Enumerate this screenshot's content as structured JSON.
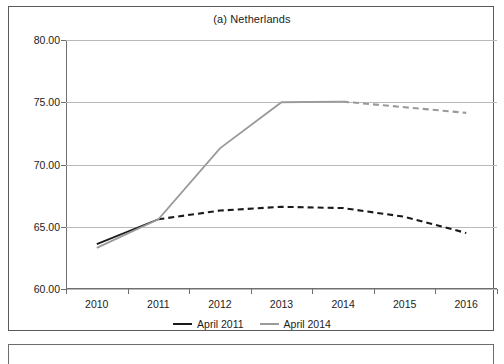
{
  "figure": {
    "title": "(a) Netherlands",
    "frame_color": "#5a5a5a",
    "background": "#ffffff"
  },
  "legend": {
    "position": "bottom-center",
    "entries": [
      {
        "label": "April 2011",
        "color": "#1a1a1a",
        "swatch_name": "legend-swatch-april-2011"
      },
      {
        "label": "April 2014",
        "color": "#9a9a9a",
        "swatch_name": "legend-swatch-april-2014"
      }
    ]
  },
  "axes": {
    "y_ticks": [
      "80.00",
      "75.00",
      "70.00",
      "65.00",
      "60.00"
    ],
    "x_ticks": [
      "2010",
      "2011",
      "2012",
      "2013",
      "2014",
      "2015",
      "2016"
    ],
    "y_min": "60.00",
    "y_max": "80.00",
    "y_step": "5.00"
  },
  "chart_data": {
    "type": "line",
    "title": "(a) Netherlands",
    "subtitle": "",
    "xlabel": "",
    "ylabel": "",
    "x": [
      2010,
      2011,
      2012,
      2013,
      2014,
      2015,
      2016
    ],
    "categories": [
      "2010",
      "2011",
      "2012",
      "2013",
      "2014",
      "2015",
      "2016"
    ],
    "ylim": [
      60.0,
      80.0
    ],
    "yticks": [
      60.0,
      65.0,
      70.0,
      75.0,
      80.0
    ],
    "ytick_labels": [
      "60.00",
      "65.00",
      "70.00",
      "75.00",
      "80.00"
    ],
    "grid": "horizontal",
    "legend_position": "bottom-center",
    "series": [
      {
        "name": "April 2011",
        "color": "#1a1a1a",
        "values": [
          63.6,
          65.6,
          66.3,
          66.6,
          66.5,
          65.8,
          64.5
        ],
        "solid_until": 2011,
        "style_after_solid": "dashed",
        "note": "solid 2010-2011 (actual), dashed 2011-2016 (projection)"
      },
      {
        "name": "April 2014",
        "color": "#9a9a9a",
        "values": [
          63.3,
          65.6,
          71.3,
          75.0,
          75.05,
          74.6,
          74.15
        ],
        "solid_until": 2014,
        "style_after_solid": "dashed",
        "note": "solid 2010-2014 (actual), dashed 2014-2016 (projection)"
      }
    ]
  }
}
